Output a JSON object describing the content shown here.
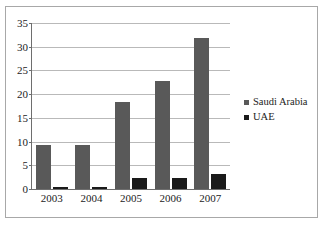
{
  "chart_data": {
    "type": "bar",
    "title": "",
    "subtitle": "",
    "xlabel": "",
    "ylabel": "",
    "categories": [
      "2003",
      "2004",
      "2005",
      "2006",
      "2007"
    ],
    "series": [
      {
        "name": "Saudi Arabia",
        "color": "#595959",
        "values": [
          9.2,
          9.3,
          18.3,
          22.7,
          31.8
        ]
      },
      {
        "name": "UAE",
        "color": "#1a1a1a",
        "values": [
          0.4,
          0.4,
          2.3,
          2.4,
          3.2
        ]
      }
    ],
    "ylim": [
      0,
      35
    ],
    "yticks": [
      0,
      5,
      10,
      15,
      20,
      25,
      30,
      35
    ],
    "ytick_labels": [
      "0",
      "5",
      "10",
      "15",
      "20",
      "25",
      "30",
      "35"
    ],
    "grid": true,
    "grid_axis": "y",
    "legend": {
      "position": "right",
      "entries": [
        {
          "label": "Saudi Arabia",
          "marker": "square",
          "color": "#595959"
        },
        {
          "label": "UAE",
          "marker": "square",
          "color": "#1a1a1a"
        }
      ]
    },
    "axis_color": "#6e6e6e",
    "gridline_color": "#b9b9b9",
    "background_color": "#ffffff",
    "border_color": "#a8a8a8"
  }
}
